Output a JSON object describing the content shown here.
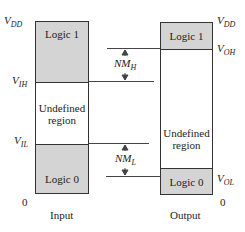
{
  "diagram": {
    "input": {
      "caption": "Input",
      "regions": {
        "logic1": "Logic 1",
        "undefined_line1": "Undefined",
        "undefined_line2": "region",
        "logic0": "Logic 0"
      },
      "labels": {
        "vdd_main": "V",
        "vdd_sub": "DD",
        "vih_main": "V",
        "vih_sub": "IH",
        "vil_main": "V",
        "vil_sub": "IL",
        "zero": "0"
      }
    },
    "output": {
      "caption": "Output",
      "regions": {
        "logic1": "Logic 1",
        "undefined_line1": "Undefined",
        "undefined_line2": "region",
        "logic0": "Logic 0"
      },
      "labels": {
        "vdd_main": "V",
        "vdd_sub": "DD",
        "voh_main": "V",
        "voh_sub": "OH",
        "vol_main": "V",
        "vol_sub": "OL",
        "zero": "0"
      }
    },
    "noise_margins": {
      "high_main": "NM",
      "high_sub": "H",
      "low_main": "NM",
      "low_sub": "L"
    },
    "colors": {
      "shaded": "#d4d4d4",
      "outline": "#333333"
    }
  }
}
